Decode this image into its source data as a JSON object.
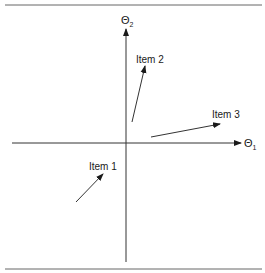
{
  "diagram": {
    "type": "vector-plot",
    "axes": {
      "x_label": "Θ",
      "x_subscript": "1",
      "y_label": "Θ",
      "y_subscript": "2"
    },
    "items": [
      {
        "label": "Item 1",
        "from": [
          76,
          202
        ],
        "to": [
          103,
          174
        ],
        "label_pos": [
          89,
          170
        ]
      },
      {
        "label": "Item 2",
        "from": [
          132,
          122
        ],
        "to": [
          145,
          66
        ],
        "label_pos": [
          136,
          63
        ]
      },
      {
        "label": "Item 3",
        "from": [
          151,
          137
        ],
        "to": [
          220,
          124
        ],
        "label_pos": [
          212,
          118
        ]
      }
    ],
    "colors": {
      "line": "#333333",
      "rule": "#666666",
      "text": "#1a1a1a"
    }
  }
}
